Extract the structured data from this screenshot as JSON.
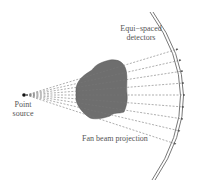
{
  "diagram": {
    "labels": {
      "detectors_line1": "Equi−spaced",
      "detectors_line2": "detectors",
      "source_line1": "Point",
      "source_line2": "source",
      "projection": "Fan beam projection"
    },
    "colors": {
      "object_fill": "#6e6e6e",
      "rays": "#777777",
      "arc": "#555555",
      "text": "#555555",
      "source": "#111111"
    },
    "source": {
      "x": 24,
      "y": 95
    },
    "detector_count": 9
  }
}
